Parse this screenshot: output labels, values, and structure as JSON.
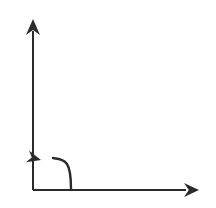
{
  "diagram": {
    "title": "Counterclockwise rotation about the origin between coordinate axes",
    "type": "line-diagram",
    "background_color": "#ffffff",
    "stroke_color": "#2b2b2b",
    "canvas": {
      "width": 216,
      "height": 208
    },
    "origin": {
      "x": 33,
      "y": 190
    },
    "elements": {
      "y_axis": {
        "name": "vertical-axis",
        "description": "Vertical axis pointing up, with solid arrowhead at top",
        "start": {
          "x": 33,
          "y": 190
        },
        "end": {
          "x": 33,
          "y": 31
        },
        "stroke_width": 2,
        "arrow_at": "end",
        "arrow_direction": "up",
        "arrow_tip": {
          "x": 33,
          "y": 19
        },
        "arrow_half_width": 7,
        "arrow_length": 16
      },
      "x_axis": {
        "name": "horizontal-axis",
        "description": "Horizontal axis pointing right, with solid arrowhead at right end",
        "start": {
          "x": 33,
          "y": 190
        },
        "end": {
          "x": 186,
          "y": 190
        },
        "stroke_width": 2,
        "arrow_at": "end",
        "arrow_direction": "right",
        "arrow_tip": {
          "x": 199,
          "y": 190
        },
        "arrow_half_width": 7,
        "arrow_length": 15
      },
      "rotation_arrow": {
        "name": "counterclockwise-rotation-arrow",
        "description": "Curved arc sweeping counterclockwise from the x-axis toward the y-axis, arrowhead pointing up-left",
        "tail": {
          "x": 71,
          "y": 189
        },
        "control": {
          "x": 71,
          "y": 160
        },
        "head_base": {
          "x": 53,
          "y": 158
        },
        "stroke_width": 2.4,
        "arrow_tip": {
          "x": 41,
          "y": 160
        },
        "arrow_direction": "up-left",
        "arrow_angle_deg": 195,
        "arrow_half_width": 6,
        "arrow_length": 14
      }
    },
    "labels": [],
    "tick_marks": [],
    "grid": false,
    "legend": null
  }
}
